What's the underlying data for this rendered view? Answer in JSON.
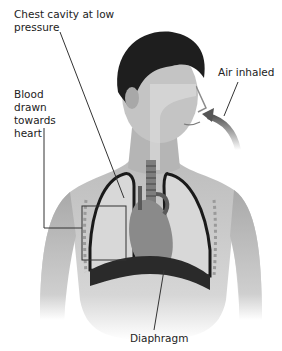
{
  "diagram": {
    "labels": {
      "chest_cavity": "Chest cavity at low\npressure",
      "blood": "Blood\ndrawn\ntowards\nheart",
      "air": "Air inhaled",
      "diaphragm": "Diaphragm"
    },
    "colors": {
      "skin": "#cfcfcf",
      "hair": "#1e1e1e",
      "lung": "#d8d8d8",
      "lung_outline": "#1a1a1a",
      "heart": "#8a8a8a",
      "leader_line": "#333333",
      "arrow": "#6a6a6a"
    }
  }
}
